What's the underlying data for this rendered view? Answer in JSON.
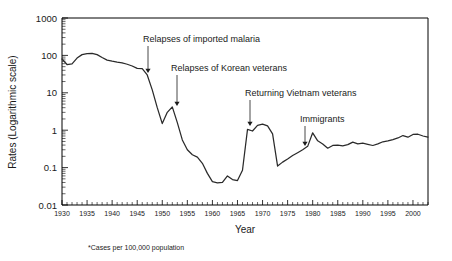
{
  "chart_data": {
    "type": "line",
    "title": "",
    "xlabel": "Year",
    "ylabel": "Rates (Logarithmic scale)",
    "footnote": "*Cases per 100,000 population",
    "yscale": "log",
    "ylim": [
      0.01,
      1000
    ],
    "xlim": [
      1930,
      2003
    ],
    "grid": false,
    "legend": "none",
    "ytick_labels": [
      "1000",
      "100",
      "10",
      "1",
      "0.1",
      "0.01"
    ],
    "ytick_values": [
      1000,
      100,
      10,
      1,
      0.1,
      0.01
    ],
    "xtick_labels": [
      "1930",
      "1935",
      "1940",
      "1945",
      "1950",
      "1955",
      "1960",
      "1965",
      "1970",
      "1975",
      "1980",
      "1985",
      "1990",
      "1995",
      "2000"
    ],
    "xtick_values": [
      1930,
      1935,
      1940,
      1945,
      1950,
      1955,
      1960,
      1965,
      1970,
      1975,
      1980,
      1985,
      1990,
      1995,
      2000
    ],
    "series": [
      {
        "name": "Malaria case rate",
        "x": [
          1930,
          1931,
          1932,
          1933,
          1934,
          1935,
          1936,
          1937,
          1938,
          1939,
          1940,
          1941,
          1942,
          1943,
          1944,
          1945,
          1946,
          1947,
          1948,
          1949,
          1950,
          1951,
          1952,
          1953,
          1954,
          1955,
          1956,
          1957,
          1958,
          1959,
          1960,
          1961,
          1962,
          1963,
          1964,
          1965,
          1966,
          1967,
          1968,
          1969,
          1970,
          1971,
          1972,
          1973,
          1974,
          1975,
          1976,
          1977,
          1978,
          1979,
          1980,
          1981,
          1982,
          1983,
          1984,
          1985,
          1986,
          1987,
          1988,
          1989,
          1990,
          1991,
          1992,
          1993,
          1994,
          1995,
          1996,
          1997,
          1998,
          1999,
          2000,
          2001,
          2002,
          2003
        ],
        "values": [
          80,
          57,
          59,
          85,
          105,
          112,
          113,
          105,
          88,
          75,
          70,
          66,
          63,
          58,
          52,
          45,
          44,
          30,
          12,
          4,
          1.5,
          3.0,
          4.2,
          1.6,
          0.55,
          0.3,
          0.22,
          0.19,
          0.13,
          0.07,
          0.042,
          0.039,
          0.04,
          0.06,
          0.048,
          0.045,
          0.085,
          1.05,
          0.95,
          1.35,
          1.45,
          1.3,
          0.8,
          0.11,
          0.14,
          0.17,
          0.21,
          0.25,
          0.3,
          0.37,
          0.85,
          0.52,
          0.43,
          0.33,
          0.39,
          0.4,
          0.38,
          0.41,
          0.48,
          0.43,
          0.45,
          0.42,
          0.39,
          0.43,
          0.49,
          0.52,
          0.56,
          0.62,
          0.72,
          0.65,
          0.77,
          0.78,
          0.7,
          0.65
        ]
      }
    ],
    "annotations": [
      {
        "label": "Relapses of imported malaria",
        "x": 1945,
        "y": 45,
        "text_x": 143,
        "text_y": 42,
        "arrow_x": 148,
        "arrow_top": 46,
        "arrow_bottom": 73
      },
      {
        "label": "Relapses of Korean veterans",
        "x": 1951,
        "y": 3.0,
        "text_x": 171,
        "text_y": 71,
        "arrow_x": 177,
        "arrow_top": 75,
        "arrow_bottom": 106
      },
      {
        "label": "Returning Vietnam veterans",
        "x": 1967,
        "y": 1.05,
        "text_x": 245,
        "text_y": 96,
        "arrow_x": 250,
        "arrow_top": 100,
        "arrow_bottom": 126
      },
      {
        "label": "Immigrants",
        "x": 1978,
        "y": 0.3,
        "text_x": 300,
        "text_y": 122,
        "arrow_x": 305,
        "arrow_top": 126,
        "arrow_bottom": 146
      }
    ]
  },
  "colors": {
    "line": "#2a2a2a",
    "axis": "#000000",
    "text": "#1a1a1a",
    "background": "#ffffff"
  }
}
